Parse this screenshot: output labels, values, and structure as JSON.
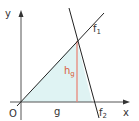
{
  "diagram": {
    "labels": {
      "y_axis": "y",
      "x_axis": "x",
      "origin": "O",
      "f1": "f",
      "f1_sub": "1",
      "f2": "f",
      "f2_sub": "2",
      "base": "g",
      "height": "h",
      "height_sub": "g"
    },
    "colors": {
      "axis": "#444444",
      "line": "#222222",
      "height_line": "#e8877a",
      "fill": "#dff3f3",
      "height_label": "#d9603b"
    }
  }
}
